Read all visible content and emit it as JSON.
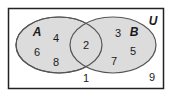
{
  "diagram": {
    "type": "venn",
    "colors": {
      "fill": "#dcdcdc",
      "stroke": "#555555",
      "border": "#222222",
      "background": "#ffffff"
    },
    "universe": {
      "label": "U",
      "outside_elements": [
        "1",
        "9"
      ]
    },
    "sets": [
      {
        "label": "A",
        "only_elements": [
          "4",
          "6",
          "8"
        ]
      },
      {
        "label": "B",
        "only_elements": [
          "3",
          "5",
          "7"
        ]
      }
    ],
    "intersection": {
      "elements": [
        "2"
      ]
    }
  },
  "labels": {
    "universe": "U",
    "set_a": "A",
    "set_b": "B",
    "a_only_4": "4",
    "a_only_6": "6",
    "a_only_8": "8",
    "b_only_3": "3",
    "b_only_5": "5",
    "b_only_7": "7",
    "both_2": "2",
    "outside_1": "1",
    "outside_9": "9"
  }
}
